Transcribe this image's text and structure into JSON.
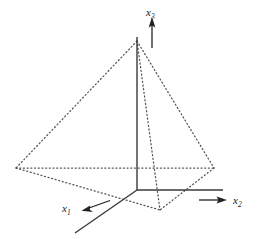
{
  "figure": {
    "background_color": "#ffffff",
    "line_color": "#555555",
    "axis_color": "#3a3a3a",
    "label_color": "#1a1a1a",
    "width": 262,
    "height": 239
  },
  "axes": [
    {
      "id": "x1",
      "label_base": "x",
      "label_sub": "1",
      "label_x": 62,
      "label_y": 212,
      "line": {
        "x1": 137,
        "y1": 190,
        "x2": 75,
        "y2": 233
      },
      "arrow": {
        "x1": 110,
        "y1": 201,
        "x2": 84,
        "y2": 210
      },
      "direction": "down-left"
    },
    {
      "id": "x2",
      "label_base": "x",
      "label_sub": "2",
      "label_x": 233,
      "label_y": 204,
      "line": {
        "x1": 137,
        "y1": 190,
        "x2": 223,
        "y2": 190
      },
      "arrow": {
        "x1": 199,
        "y1": 200,
        "x2": 226,
        "y2": 200
      },
      "direction": "right"
    },
    {
      "id": "x3",
      "label_base": "x",
      "label_sub": "3",
      "label_x": 148,
      "label_y": 16,
      "line": {
        "x1": 137,
        "y1": 190,
        "x2": 137,
        "y2": 37
      },
      "arrow": {
        "x1": 152,
        "y1": 48,
        "x2": 152,
        "y2": 19
      },
      "direction": "up"
    }
  ],
  "vertices": [
    {
      "id": "origin",
      "x": 137,
      "y": 190
    },
    {
      "id": "apex",
      "x": 137,
      "y": 41
    },
    {
      "id": "left",
      "x": 16,
      "y": 168
    },
    {
      "id": "right",
      "x": 214,
      "y": 168
    },
    {
      "id": "front",
      "x": 160,
      "y": 210
    }
  ],
  "edges": [
    {
      "from": "apex",
      "to": "left",
      "style": "dotted"
    },
    {
      "from": "apex",
      "to": "right",
      "style": "dotted"
    },
    {
      "from": "apex",
      "to": "front",
      "style": "dotted"
    },
    {
      "from": "left",
      "to": "right",
      "style": "dotted"
    },
    {
      "from": "left",
      "to": "front",
      "style": "dotted"
    },
    {
      "from": "right",
      "to": "front",
      "style": "dotted"
    }
  ]
}
